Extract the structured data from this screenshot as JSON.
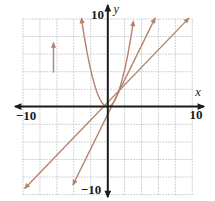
{
  "chart_data": {
    "type": "line",
    "title": "",
    "xlabel": "x",
    "ylabel": "y",
    "xlim": [
      -10,
      10
    ],
    "ylim": [
      -10,
      10
    ],
    "grid": true,
    "grid_step": 2,
    "axis_tick_labels": {
      "x_min": "−10",
      "x_max": "10",
      "y_min": "−10",
      "y_max": "10"
    },
    "series": [
      {
        "id": "line-y-equals-x",
        "name": "y = x",
        "kind": "line",
        "points": [
          [
            -9.8,
            -9.3
          ],
          [
            9.6,
            10.1
          ]
        ],
        "arrows": "both"
      },
      {
        "id": "line-y-equals-2x",
        "name": "y = 2x",
        "kind": "line",
        "points": [
          [
            -4.1,
            -8.9
          ],
          [
            5.6,
            10.1
          ]
        ],
        "arrows": "both"
      },
      {
        "id": "parabola-y-equals-x-squared",
        "name": "y = x²",
        "kind": "parabola",
        "a": 1.05,
        "x_range": [
          -3.1,
          3.05
        ],
        "arrows": "both"
      },
      {
        "id": "vertical-arrow-annotation",
        "name": "short vertical arrow",
        "kind": "segment",
        "points": [
          [
            -6.4,
            3.9
          ],
          [
            -6.4,
            7.3
          ]
        ],
        "arrows": "end"
      }
    ],
    "colors": {
      "curve": "#b3846a",
      "axis": "#1b1b1b",
      "grid": "#bcc0c6",
      "background": "#ffffff",
      "label": "#1b1b1b"
    }
  }
}
